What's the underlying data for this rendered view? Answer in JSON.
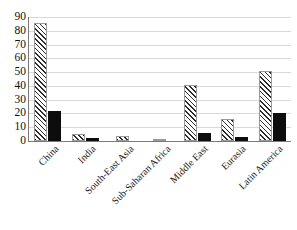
{
  "chart_data": {
    "type": "bar",
    "title": "",
    "subtitle": "",
    "xlabel": "",
    "ylabel": "",
    "ylim": [
      0,
      90
    ],
    "ytick_step": 10,
    "yticks": [
      90,
      80,
      70,
      60,
      50,
      40,
      30,
      20,
      10,
      0
    ],
    "grid": true,
    "grid_axis": "y",
    "legend": false,
    "legend_position": "none",
    "categories": [
      "China",
      "India",
      "South-East Asia",
      "Sub-Saharan Africa",
      "Middle East",
      "Eurasia",
      "Latin America"
    ],
    "series": [
      {
        "name": "series-hatched",
        "style": "diagonal-hatch",
        "color": "#2b2b2b",
        "values": [
          86,
          5,
          4,
          1,
          41,
          16,
          51
        ]
      },
      {
        "name": "series-solid",
        "style": "solid-fill",
        "color": "#0d0d0d",
        "values": [
          22,
          2,
          0,
          0,
          6,
          3,
          20
        ]
      }
    ]
  },
  "axes": {
    "y": {
      "tick_labels": [
        "90",
        "80",
        "70",
        "60",
        "50",
        "40",
        "30",
        "20",
        "10",
        "0"
      ]
    },
    "x": {
      "tick_labels": [
        "China",
        "India",
        "South-East Asia",
        "Sub-Saharan Africa",
        "Middle East",
        "Eurasia",
        "Latin America"
      ]
    }
  },
  "colors": {
    "axis_line": "#7a7a7a",
    "gridline": "#d9d9d9",
    "background": "#ffffff",
    "text": "#141414",
    "hatch": "#2b2b2b",
    "solid_bar": "#0d0d0d"
  }
}
